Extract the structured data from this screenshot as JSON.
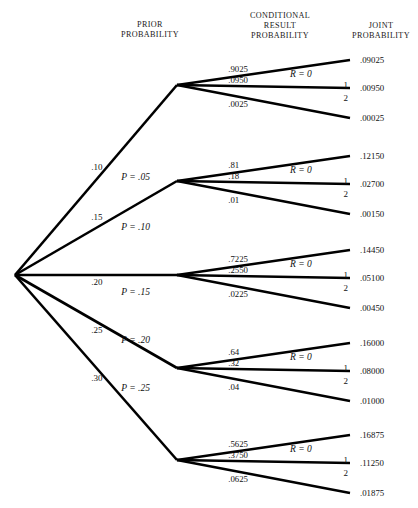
{
  "headers": {
    "prior": "PRIOR\nPROBABILITY",
    "prior_line1": "PRIOR",
    "prior_line2": "PROBABILITY",
    "conditional_line1": "CONDITIONAL",
    "conditional_line2": "RESULT",
    "conditional_line3": "PROBABILITY",
    "joint_line1": "JOINT",
    "joint_line2": "PROBABILITY"
  },
  "chart_data": {
    "type": "diagram",
    "diagram_type": "probability-tree",
    "title": "",
    "root_label": "",
    "columns": [
      "PRIOR PROBABILITY",
      "CONDITIONAL RESULT PROBABILITY",
      "JOINT PROBABILITY"
    ],
    "result_labels": [
      "R = 0",
      "1",
      "2"
    ],
    "branches": [
      {
        "prior": ".10",
        "p_label": "P = .05",
        "p_value": 0.05,
        "conditionals": [
          ".9025",
          ".0950",
          ".0025"
        ],
        "conditional_values": [
          0.9025,
          0.095,
          0.0025
        ],
        "joints": [
          ".09025",
          ".00950",
          ".00025"
        ],
        "joint_values": [
          0.09025,
          0.0095,
          0.00025
        ]
      },
      {
        "prior": ".15",
        "p_label": "P = .10",
        "p_value": 0.1,
        "conditionals": [
          ".81",
          ".18",
          ".01"
        ],
        "conditional_values": [
          0.81,
          0.18,
          0.01
        ],
        "joints": [
          ".12150",
          ".02700",
          ".00150"
        ],
        "joint_values": [
          0.1215,
          0.027,
          0.0015
        ]
      },
      {
        "prior": ".20",
        "p_label": "P = .15",
        "p_value": 0.15,
        "conditionals": [
          ".7225",
          ".2550",
          ".0225"
        ],
        "conditional_values": [
          0.7225,
          0.255,
          0.0225
        ],
        "joints": [
          ".14450",
          ".05100",
          ".00450"
        ],
        "joint_values": [
          0.1445,
          0.051,
          0.0045
        ]
      },
      {
        "prior": ".25",
        "p_label": "P = .20",
        "p_value": 0.2,
        "conditionals": [
          ".64",
          ".32",
          ".04"
        ],
        "conditional_values": [
          0.64,
          0.32,
          0.04
        ],
        "joints": [
          ".16000",
          ".08000",
          ".01000"
        ],
        "joint_values": [
          0.16,
          0.08,
          0.01
        ]
      },
      {
        "prior": ".30",
        "p_label": "P = .25",
        "p_value": 0.25,
        "conditionals": [
          ".5625",
          ".3750",
          ".0625"
        ],
        "conditional_values": [
          0.5625,
          0.375,
          0.0625
        ],
        "joints": [
          ".16875",
          ".11250",
          ".01875"
        ],
        "joint_values": [
          0.16875,
          0.1125,
          0.01875
        ]
      }
    ]
  },
  "colors": {
    "line": "#000000",
    "text": "#111111",
    "background": "#ffffff"
  }
}
